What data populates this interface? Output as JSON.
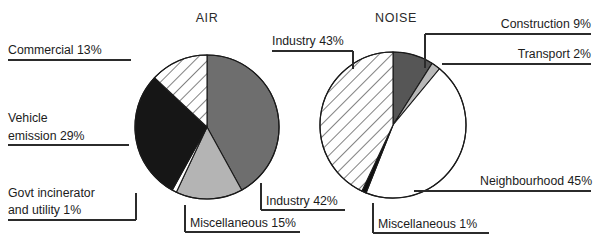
{
  "figure": {
    "background": "#ffffff",
    "width": 598,
    "height": 249
  },
  "charts": [
    {
      "id": "air",
      "title": "AIR",
      "title_x": 207,
      "title_y": 22,
      "cx": 207,
      "cy": 127,
      "r": 72,
      "slices": [
        {
          "label": "Industry",
          "value": 42,
          "label_text": "Industry 42%",
          "fill": "#6e6e6e",
          "pattern": "solid"
        },
        {
          "label": "Miscellaneous",
          "value": 15,
          "label_text": "Miscellaneous 15%",
          "fill": "#b4b4b4",
          "pattern": "solid"
        },
        {
          "label": "Govt incinerator and utility",
          "value": 1,
          "label_text": "Govt incinerator and utility 1%",
          "fill": "#ffffff",
          "pattern": "solid"
        },
        {
          "label": "Vehicle emission",
          "value": 29,
          "label_text": "Vehicle emission 29%",
          "fill": "#161616",
          "pattern": "solid"
        },
        {
          "label": "Commercial",
          "value": 13,
          "label_text": "Commercial 13%",
          "fill": "#ffffff",
          "pattern": "hatch"
        }
      ]
    },
    {
      "id": "noise",
      "title": "NOISE",
      "title_x": 396,
      "title_y": 22,
      "cx": 393,
      "cy": 125,
      "r": 73,
      "slices": [
        {
          "label": "Construction",
          "value": 9,
          "label_text": "Construction 9%",
          "fill": "#565656",
          "pattern": "solid"
        },
        {
          "label": "Transport",
          "value": 2,
          "label_text": "Transport 2%",
          "fill": "#b8b8b8",
          "pattern": "solid"
        },
        {
          "label": "Neighbourhood",
          "value": 45,
          "label_text": "Neighbourhood 45%",
          "fill": "#ffffff",
          "pattern": "solid"
        },
        {
          "label": "Miscellaneous",
          "value": 1,
          "label_text": "Miscellaneous 1%",
          "fill": "#101010",
          "pattern": "solid"
        },
        {
          "label": "Industry",
          "value": 43,
          "label_text": "Industry 43%",
          "fill": "#ffffff",
          "pattern": "hatch"
        }
      ]
    }
  ],
  "callouts": [
    {
      "id": "air-commercial",
      "text": "Commercial 13%",
      "x": 8,
      "y": 54,
      "anchor": "start",
      "lines": [
        [
          8,
          60,
          "H",
          131
        ]
      ]
    },
    {
      "id": "air-vehicle-1",
      "text": "Vehicle",
      "x": 8,
      "y": 122,
      "anchor": "start",
      "lines": []
    },
    {
      "id": "air-vehicle-2",
      "text": "emission 29%",
      "x": 8,
      "y": 140,
      "anchor": "start",
      "lines": [
        [
          8,
          145,
          "H",
          129
        ]
      ]
    },
    {
      "id": "air-govt-1",
      "text": "Govt incinerator",
      "x": 8,
      "y": 197,
      "anchor": "start",
      "lines": []
    },
    {
      "id": "air-govt-2",
      "text": "and utility 1%",
      "x": 8,
      "y": 214,
      "anchor": "start",
      "lines": [
        [
          8,
          220,
          "H",
          136
        ],
        [
          136,
          220,
          "V",
          193
        ]
      ]
    },
    {
      "id": "air-misc",
      "text": "Miscellaneous 15%",
      "x": 190,
      "y": 227,
      "anchor": "start",
      "lines": [
        [
          185,
          232,
          "H",
          300
        ],
        [
          185,
          232,
          "V",
          205
        ]
      ]
    },
    {
      "id": "air-industry",
      "text": "Industry 42%",
      "x": 266,
      "y": 205,
      "anchor": "start",
      "lines": [
        [
          261,
          210,
          "H",
          345
        ],
        [
          261,
          210,
          "V",
          183
        ]
      ]
    },
    {
      "id": "noise-industry",
      "text": "Industry 43%",
      "x": 272,
      "y": 45,
      "anchor": "start",
      "lines": [
        [
          272,
          51,
          "H",
          353
        ],
        [
          353,
          51,
          "V",
          69
        ]
      ]
    },
    {
      "id": "noise-construction",
      "text": "Construction 9%",
      "x": 591,
      "y": 28,
      "anchor": "end",
      "lines": [
        [
          425,
          34,
          "H",
          591
        ],
        [
          425,
          34,
          "V",
          68
        ]
      ]
    },
    {
      "id": "noise-transport",
      "text": "Transport 2%",
      "x": 591,
      "y": 58,
      "anchor": "end",
      "lines": [
        [
          442,
          64,
          "H",
          591
        ]
      ]
    },
    {
      "id": "noise-neighbourhood",
      "text": "Neighbourhood 45%",
      "x": 480,
      "y": 185,
      "anchor": "start",
      "lines": [
        [
          414,
          191,
          "H",
          591
        ]
      ]
    },
    {
      "id": "noise-misc",
      "text": "Miscellaneous 1%",
      "x": 378,
      "y": 228,
      "anchor": "start",
      "lines": [
        [
          373,
          233,
          "H",
          489
        ],
        [
          373,
          233,
          "V",
          203
        ]
      ]
    }
  ]
}
